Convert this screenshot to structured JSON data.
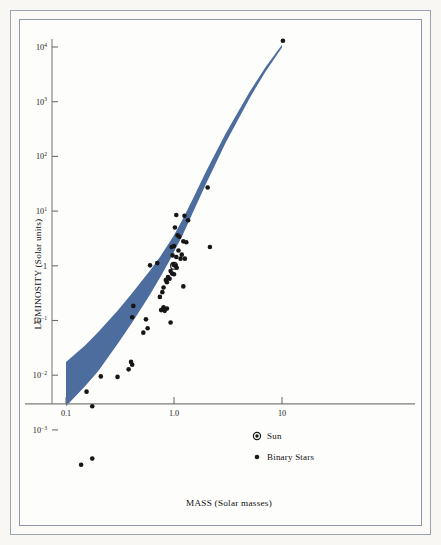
{
  "figure": {
    "background_color": "#f8f7f3",
    "panel_color": "#fdfdfb",
    "frame_color": "#9aa3b0"
  },
  "chart_data": {
    "type": "scatter",
    "title": "",
    "xlabel": "MASS (Solar masses)",
    "ylabel": "LUMINOSITY (Solar units)",
    "xscale": "log",
    "yscale": "log",
    "xlim": [
      0.055,
      22
    ],
    "ylim": [
      0.00012,
      30000
    ],
    "grid": false,
    "xticks": [
      0.1,
      1.0,
      10
    ],
    "xticklabels": [
      "0.1",
      "1.0",
      "10"
    ],
    "yticks": [
      0.001,
      0.01,
      0.1,
      1,
      10,
      100,
      1000,
      10000
    ],
    "yticklabels": [
      "10−3",
      "10−2",
      "10−1",
      "1",
      "10¹",
      "10²",
      "10³",
      "10⁴"
    ],
    "ytick_mantissas": [
      "10",
      "10",
      "10",
      "1",
      "10",
      "10",
      "10",
      "10"
    ],
    "ytick_exponents": [
      "-3",
      "-2",
      "-1",
      "",
      "1",
      "2",
      "3",
      "4"
    ],
    "legend": {
      "position": "lower-right-inside",
      "entries": [
        {
          "label": "Sun",
          "marker": "bullseye",
          "color": "#1a1a1a"
        },
        {
          "label": "Binary Stars",
          "marker": "filled-circle",
          "color": "#1a1a1a"
        }
      ]
    },
    "band": {
      "name": "Mass-Luminosity Relation band",
      "color": "#4d6d9e",
      "description": "Shaded theoretical mass-luminosity relation band widening toward low mass",
      "upper_edge": [
        [
          0.1,
          0.0175
        ],
        [
          0.15,
          0.035
        ],
        [
          0.2,
          0.062
        ],
        [
          0.3,
          0.15
        ],
        [
          0.4,
          0.3
        ],
        [
          0.5,
          0.52
        ],
        [
          0.6,
          0.82
        ],
        [
          0.75,
          1.5
        ],
        [
          0.9,
          2.6
        ],
        [
          1.0,
          3.6
        ],
        [
          1.2,
          7.0
        ],
        [
          1.5,
          17
        ],
        [
          2.0,
          55
        ],
        [
          3.0,
          260
        ],
        [
          5.0,
          1500
        ],
        [
          7.0,
          4200
        ],
        [
          10.0,
          11000
        ]
      ],
      "lower_edge": [
        [
          0.1,
          0.0027
        ],
        [
          0.15,
          0.0063
        ],
        [
          0.2,
          0.012
        ],
        [
          0.3,
          0.037
        ],
        [
          0.4,
          0.085
        ],
        [
          0.5,
          0.17
        ],
        [
          0.6,
          0.3
        ],
        [
          0.75,
          0.63
        ],
        [
          0.9,
          1.2
        ],
        [
          1.0,
          1.8
        ],
        [
          1.2,
          3.6
        ],
        [
          1.5,
          9.5
        ],
        [
          2.0,
          33
        ],
        [
          3.0,
          175
        ],
        [
          5.0,
          1150
        ],
        [
          7.0,
          3500
        ],
        [
          10.0,
          9800
        ]
      ]
    },
    "series": [
      {
        "name": "Sun",
        "marker": "bullseye",
        "color": "#1a1a1a",
        "points": [
          [
            1.0,
            1.0
          ]
        ]
      },
      {
        "name": "Binary Stars",
        "marker": "filled-circle",
        "color": "#161616",
        "points": [
          [
            10.2,
            13000
          ],
          [
            2.05,
            27
          ],
          [
            1.25,
            8.2
          ],
          [
            1.05,
            8.5
          ],
          [
            1.35,
            6.8
          ],
          [
            1.02,
            5.0
          ],
          [
            1.08,
            3.6
          ],
          [
            1.12,
            3.4
          ],
          [
            1.22,
            2.8
          ],
          [
            1.3,
            2.7
          ],
          [
            2.15,
            2.2
          ],
          [
            1.0,
            2.3
          ],
          [
            0.95,
            2.2
          ],
          [
            1.1,
            1.9
          ],
          [
            1.18,
            1.6
          ],
          [
            0.97,
            1.55
          ],
          [
            1.05,
            1.45
          ],
          [
            1.15,
            1.35
          ],
          [
            1.26,
            1.35
          ],
          [
            0.6,
            1.02
          ],
          [
            0.7,
            1.12
          ],
          [
            0.99,
            1.05
          ],
          [
            1.03,
            1.0
          ],
          [
            1.06,
            0.92
          ],
          [
            0.93,
            0.8
          ],
          [
            0.96,
            0.72
          ],
          [
            1.0,
            0.7
          ],
          [
            0.88,
            0.62
          ],
          [
            0.91,
            0.58
          ],
          [
            0.84,
            0.55
          ],
          [
            0.86,
            0.5
          ],
          [
            1.22,
            0.42
          ],
          [
            0.8,
            0.4
          ],
          [
            0.78,
            0.33
          ],
          [
            0.74,
            0.27
          ],
          [
            0.42,
            0.185
          ],
          [
            0.8,
            0.175
          ],
          [
            0.86,
            0.165
          ],
          [
            0.76,
            0.155
          ],
          [
            0.82,
            0.15
          ],
          [
            0.41,
            0.115
          ],
          [
            0.55,
            0.105
          ],
          [
            0.93,
            0.092
          ],
          [
            0.57,
            0.072
          ],
          [
            0.52,
            0.06
          ],
          [
            0.4,
            0.0175
          ],
          [
            0.41,
            0.0155
          ],
          [
            0.38,
            0.0128
          ],
          [
            0.21,
            0.0095
          ],
          [
            0.3,
            0.0093
          ],
          [
            0.155,
            0.005
          ],
          [
            0.175,
            0.0027
          ],
          [
            0.175,
            0.0003
          ],
          [
            0.138,
            0.00023
          ]
        ]
      }
    ]
  }
}
